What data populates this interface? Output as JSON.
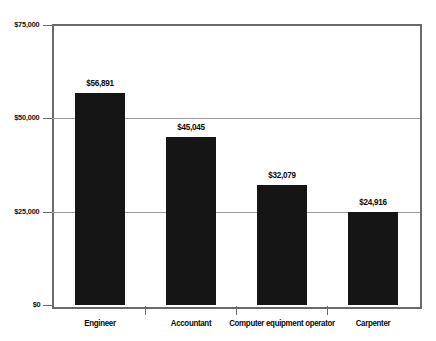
{
  "chart_data": {
    "type": "bar",
    "title": "",
    "xlabel": "",
    "ylabel": "",
    "categories": [
      "Engineer",
      "Accountant",
      "Computer equipment operator",
      "Carpenter"
    ],
    "values": [
      56891,
      45045,
      32079,
      24916
    ],
    "value_labels": [
      "$56,891",
      "$45,045",
      "$32,079",
      "$24,916"
    ],
    "ylim": [
      0,
      75000
    ],
    "ytick_values": [
      0,
      25000,
      50000,
      75000
    ],
    "ytick_labels": [
      "$0",
      "$25,000",
      "$50,000",
      "$75,000"
    ],
    "grid": true,
    "legend": "none",
    "colors": {
      "bar": "#151515",
      "gridline": "#9a9a9a",
      "axis": "#6a6a6a",
      "text": "#0a0a0a",
      "background": "#ffffff"
    }
  }
}
